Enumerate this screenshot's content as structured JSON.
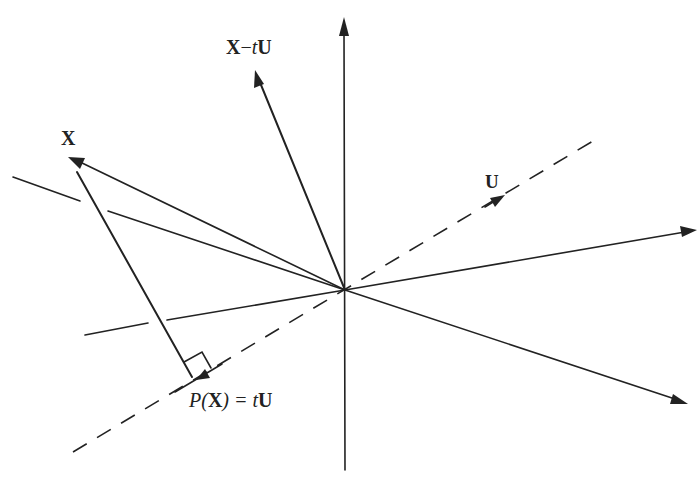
{
  "diagram": {
    "type": "vector projection onto a line",
    "labels": {
      "x_vector": "X",
      "difference_vector": "X−tU",
      "unit_vector": "U",
      "projection": "P(X) = tU",
      "projection_parts": {
        "p": "P(",
        "x": "X",
        "rest": ") = ",
        "t": "t",
        "u": "U"
      },
      "difference_parts": {
        "x": "X",
        "minus": "−",
        "t": "t",
        "u": "U"
      }
    },
    "elements": [
      "vertical axis with arrow up",
      "vector X from origin",
      "vector X−tU from origin",
      "unit vector U along dashed line",
      "dashed line spanned by U",
      "projection P(X)=tU with right-angle marker",
      "two arrows to the right (plane axes)",
      "plane boundary lines"
    ],
    "colors": {
      "ink": "#222222",
      "background": "#ffffff"
    }
  }
}
